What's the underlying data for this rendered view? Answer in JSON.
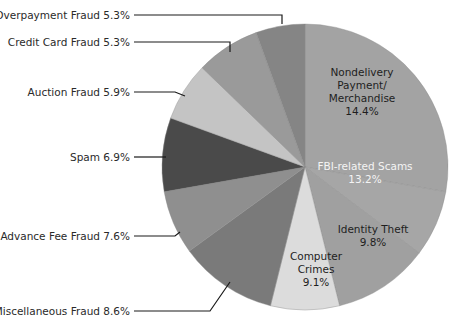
{
  "chart_data": {
    "type": "pie",
    "title": "",
    "start_angle_deg": 0,
    "direction": "clockwise",
    "slices": [
      {
        "label": "Nondelivery Payment/ Merchandise",
        "value": 14.4,
        "color": "#a3a3a3",
        "end_deg": 100
      },
      {
        "label": "FBI-related Scams",
        "value": 13.2,
        "color": "#a6a6a6",
        "end_deg": 127
      },
      {
        "label": "Identity Theft",
        "value": 9.8,
        "color": "#a0a0a0",
        "end_deg": 166
      },
      {
        "label": "Computer Crimes",
        "value": 9.1,
        "color": "#dcdcdc",
        "end_deg": 194
      },
      {
        "label": "Miscellaneous Fraud",
        "value": 8.6,
        "color": "#7a7a7a",
        "end_deg": 234
      },
      {
        "label": "Advance Fee Fraud",
        "value": 7.6,
        "color": "#8f8f8f",
        "end_deg": 260
      },
      {
        "label": "Spam",
        "value": 6.9,
        "color": "#4a4a4a",
        "end_deg": 290
      },
      {
        "label": "Auction Fraud",
        "value": 5.9,
        "color": "#c4c4c4",
        "end_deg": 314
      },
      {
        "label": "Credit Card Fraud",
        "value": 5.3,
        "color": "#9a9a9a",
        "end_deg": 340
      },
      {
        "label": "Overpayment Fraud",
        "value": 5.3,
        "color": "#858585",
        "end_deg": 360
      }
    ],
    "legend": "leader-line labels",
    "units": "%"
  },
  "labels": {
    "overpayment": "Overpayment Fraud 5.3%",
    "credit_card": "Credit Card Fraud 5.3%",
    "auction": "Auction Fraud 5.9%",
    "spam": "Spam 6.9%",
    "advance_fee": "Advance Fee Fraud 7.6%",
    "misc": "Miscellaneous Fraud 8.6%",
    "nondelivery_l1": "Nondelivery",
    "nondelivery_l2": "Payment/",
    "nondelivery_l3": "Merchandise",
    "nondelivery_pct": "14.4%",
    "fbi_l1": "FBI-related Scams",
    "fbi_pct": "13.2%",
    "identity_l1": "Identity Theft",
    "identity_pct": "9.8%",
    "computer_l1": "Computer",
    "computer_l2": "Crimes",
    "computer_pct": "9.1%"
  }
}
